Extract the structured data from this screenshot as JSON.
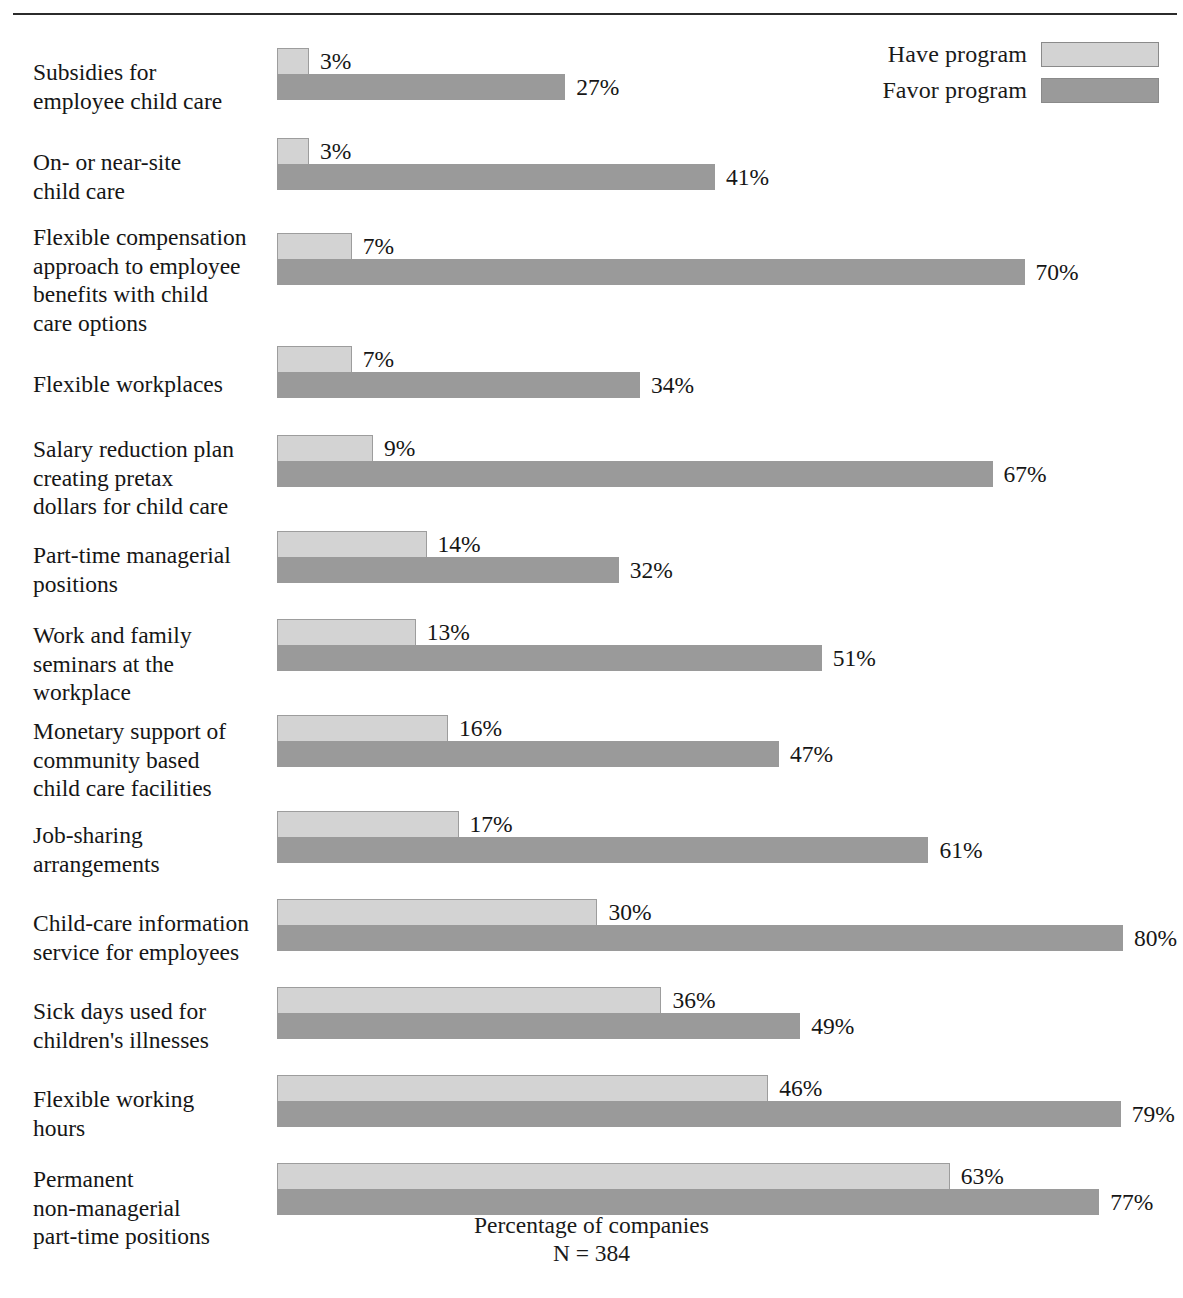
{
  "legend": {
    "items": [
      {
        "label": "Have program",
        "key": "have",
        "color": "#d3d3d3"
      },
      {
        "label": "Favor program",
        "key": "favor",
        "color": "#9a9a9a"
      }
    ]
  },
  "axis": {
    "caption_line1": "Percentage of companies",
    "caption_line2": "N = 384"
  },
  "chart_data": {
    "type": "bar",
    "orientation": "horizontal",
    "title": "",
    "xlabel": "Percentage of companies",
    "ylabel": "",
    "xlim": [
      0,
      80
    ],
    "grid": false,
    "legend_position": "top-right",
    "annotations": [
      "N = 384"
    ],
    "value_suffix": "%",
    "categories": [
      "Subsidies for employee child care",
      "On- or near-site child care",
      "Flexible compensation approach to employee benefits with child care options",
      "Flexible workplaces",
      "Salary reduction plan creating pretax dollars for child care",
      "Part-time managerial positions",
      "Work and family seminars at the workplace",
      "Monetary support of community based child care facilities",
      "Job-sharing arrangements",
      "Child-care information service for employees",
      "Sick days used for children's illnesses",
      "Flexible working hours",
      "Permanent non-managerial part-time positions"
    ],
    "series": [
      {
        "name": "Have program",
        "color": "#d3d3d3",
        "values": [
          3,
          3,
          7,
          7,
          9,
          14,
          13,
          16,
          17,
          30,
          36,
          46,
          63
        ]
      },
      {
        "name": "Favor program",
        "color": "#9a9a9a",
        "values": [
          27,
          41,
          70,
          34,
          67,
          32,
          51,
          47,
          61,
          80,
          49,
          79,
          77
        ]
      }
    ]
  },
  "rows": [
    {
      "label_lines": [
        "Subsidies for",
        "employee child care"
      ],
      "have": 3,
      "favor": 27,
      "have_text": "3%",
      "favor_text": "27%",
      "label_top": 22,
      "bar_top": 12,
      "height": 90
    },
    {
      "label_lines": [
        "On- or near-site",
        "child care"
      ],
      "have": 3,
      "favor": 41,
      "have_text": "3%",
      "favor_text": "41%",
      "label_top": 22,
      "bar_top": 12,
      "height": 90
    },
    {
      "label_lines": [
        "Flexible compensation",
        "approach to employee",
        "benefits with child",
        "care options"
      ],
      "have": 7,
      "favor": 70,
      "have_text": "7%",
      "favor_text": "70%",
      "label_top": 7,
      "bar_top": 17,
      "height": 122
    },
    {
      "label_lines": [
        "Flexible workplaces"
      ],
      "have": 7,
      "favor": 34,
      "have_text": "7%",
      "favor_text": "34%",
      "label_top": 32,
      "bar_top": 8,
      "height": 86
    },
    {
      "label_lines": [
        "Salary reduction plan",
        "creating pretax",
        "dollars for child care"
      ],
      "have": 9,
      "favor": 67,
      "have_text": "9%",
      "favor_text": "67%",
      "label_top": 11,
      "bar_top": 11,
      "height": 97
    },
    {
      "label_lines": [
        "Part-time managerial",
        "positions"
      ],
      "have": 14,
      "favor": 32,
      "have_text": "14%",
      "favor_text": "32%",
      "label_top": 20,
      "bar_top": 10,
      "height": 88
    },
    {
      "label_lines": [
        "Work and family",
        "seminars at the",
        "workplace"
      ],
      "have": 13,
      "favor": 51,
      "have_text": "13%",
      "favor_text": "51%",
      "label_top": 12,
      "bar_top": 10,
      "height": 96
    },
    {
      "label_lines": [
        "Monetary support of",
        "community based",
        "child care facilities"
      ],
      "have": 16,
      "favor": 47,
      "have_text": "16%",
      "favor_text": "47%",
      "label_top": 12,
      "bar_top": 10,
      "height": 96
    },
    {
      "label_lines": [
        "Job-sharing",
        "arrangements"
      ],
      "have": 17,
      "favor": 61,
      "have_text": "17%",
      "favor_text": "61%",
      "label_top": 20,
      "bar_top": 10,
      "height": 88
    },
    {
      "label_lines": [
        "Child-care information",
        "service for employees"
      ],
      "have": 30,
      "favor": 80,
      "have_text": "30%",
      "favor_text": "80%",
      "label_top": 20,
      "bar_top": 10,
      "height": 88
    },
    {
      "label_lines": [
        "Sick days used for",
        "children's illnesses"
      ],
      "have": 36,
      "favor": 49,
      "have_text": "36%",
      "favor_text": "49%",
      "label_top": 20,
      "bar_top": 10,
      "height": 88
    },
    {
      "label_lines": [
        "Flexible working",
        "hours"
      ],
      "have": 46,
      "favor": 79,
      "have_text": "46%",
      "favor_text": "79%",
      "label_top": 20,
      "bar_top": 10,
      "height": 88
    },
    {
      "label_lines": [
        "Permanent",
        "non-managerial",
        "part-time positions"
      ],
      "have": 63,
      "favor": 77,
      "have_text": "63%",
      "favor_text": "77%",
      "label_top": 12,
      "bar_top": 10,
      "height": 96
    }
  ]
}
